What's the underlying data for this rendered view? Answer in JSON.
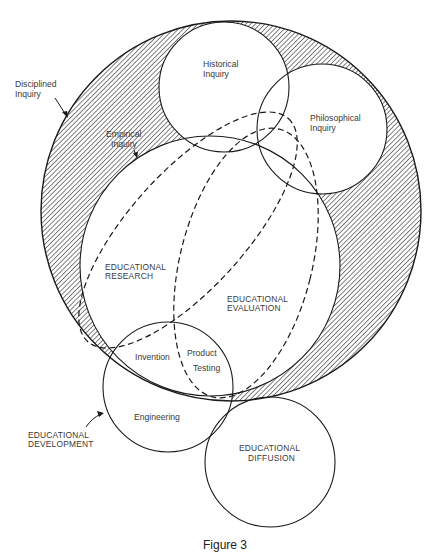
{
  "figure": {
    "caption": "Figure 3",
    "page_mark": ""
  },
  "regions": {
    "disciplined_inquiry": {
      "line1": "Disciplined",
      "line2": "Inquiry"
    },
    "empirical_inquiry": {
      "line1": "Empirical",
      "line2": "Inquiry"
    },
    "historical_inquiry": {
      "line1": "Historical",
      "line2": "Inquiry"
    },
    "philosophical_inquiry": {
      "line1": "Philosophical",
      "line2": "Inquiry"
    },
    "educational_research": {
      "line1": "EDUCATIONAL",
      "line2": "RESEARCH"
    },
    "educational_evaluation": {
      "line1": "EDUCATIONAL",
      "line2": "EVALUATION"
    },
    "educational_development": {
      "line1": "EDUCATIONAL",
      "line2": "DEVELOPMENT"
    },
    "educational_diffusion": {
      "line1": "EDUCATIONAL",
      "line2": "DIFFUSION"
    },
    "invention": {
      "label": "Invention"
    },
    "product_testing": {
      "line1": "Product",
      "line2": "Testing"
    },
    "engineering": {
      "label": "Engineering"
    }
  },
  "style": {
    "line_color": "#1a1a1a",
    "text_color": "#3a3a3a",
    "background": "#ffffff"
  }
}
